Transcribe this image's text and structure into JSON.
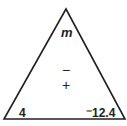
{
  "diagram": {
    "type": "fact-triangle",
    "stroke_color": "#231f20",
    "top": {
      "value": "m"
    },
    "operations": {
      "minus": "−",
      "plus": "+"
    },
    "bottom_left": {
      "value": "4"
    },
    "bottom_right": {
      "value": "⁻12.4"
    }
  }
}
